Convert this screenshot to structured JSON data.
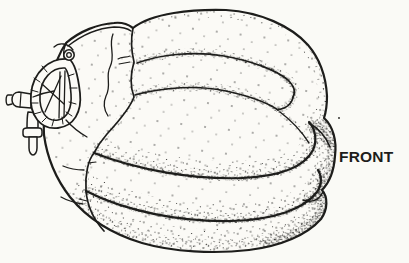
{
  "colors": {
    "background": "#fafaf6",
    "paper": "#fbfaf6",
    "ink": "#1d1d1b"
  },
  "labels": {
    "front": "FRONT"
  }
}
